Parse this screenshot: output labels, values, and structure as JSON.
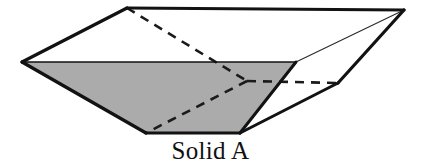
{
  "figure": {
    "caption": "Solid A",
    "colors": {
      "background": "#ffffff",
      "outline": "#121212",
      "shaded_face": "#ababab",
      "unshaded_face": "#ffffff",
      "hidden_edge": "#1a1a1a",
      "thin_edge": "#2a2a2a",
      "caption_text": "#111111"
    },
    "shape": {
      "type": "truncated-pyramid-frustum",
      "vertices": {
        "top_left_front": [
          22,
          62
        ],
        "top_left_back": [
          127,
          8
        ],
        "top_right_back": [
          404,
          10
        ],
        "top_right_front": [
          296,
          62
        ],
        "bottom_left_front": [
          146,
          133
        ],
        "bottom_right_front": [
          240,
          133
        ],
        "bottom_right_back": [
          338,
          83
        ],
        "bottom_left_back_hidden": [
          247,
          81
        ]
      },
      "faces": [
        {
          "name": "top-face",
          "fill": "unshaded",
          "points": "22,62 127,8 404,10 296,62"
        },
        {
          "name": "front-face-shaded",
          "fill": "shaded",
          "points": "22,62 296,62 240,133 146,133"
        },
        {
          "name": "right-face",
          "fill": "unshaded",
          "points": "296,62 404,10 338,83 240,133"
        }
      ],
      "solid_edges": [
        {
          "name": "top-front-left-edge",
          "points": "22,62 127,8",
          "weight": 3.2
        },
        {
          "name": "top-back-edge",
          "points": "127,8 404,10",
          "weight": 3.2
        },
        {
          "name": "top-front-right-edge",
          "points": "296,62 404,10",
          "weight": 1.1
        },
        {
          "name": "top-front-edge",
          "points": "22,62 296,62",
          "weight": 1.6
        },
        {
          "name": "front-left-slant-edge",
          "points": "22,62 146,133",
          "weight": 3.2
        },
        {
          "name": "bottom-front-edge",
          "points": "146,133 240,133",
          "weight": 3.2
        },
        {
          "name": "front-right-slant-edge",
          "points": "296,62 240,133",
          "weight": 3.0
        },
        {
          "name": "bottom-right-slant-edge",
          "points": "240,133 338,83",
          "weight": 3.0
        },
        {
          "name": "right-back-slant-edge",
          "points": "338,83 404,10",
          "weight": 3.2
        }
      ],
      "hidden_edges": [
        {
          "name": "hidden-edge-back-left-vertical",
          "points": "127,8 247,81"
        },
        {
          "name": "hidden-edge-back-bottom-left",
          "points": "247,81 146,133"
        },
        {
          "name": "hidden-edge-back-bottom-right",
          "points": "247,81 338,83"
        }
      ]
    }
  }
}
